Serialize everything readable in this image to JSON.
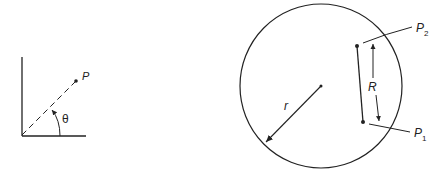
{
  "left_figure": {
    "point_label": "P",
    "angle_label": "θ"
  },
  "right_figure": {
    "radius_label": "r",
    "distance_label": "R",
    "point2_label": "P",
    "point2_subscript": "2",
    "point1_label": "P",
    "point1_subscript": "1"
  },
  "colors": {
    "stroke": "#222222",
    "background": "#ffffff"
  }
}
